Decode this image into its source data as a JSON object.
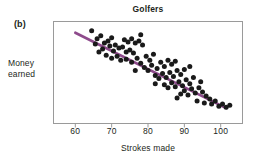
{
  "figure": {
    "panel_label": "(b)",
    "title": "Golfers",
    "ylabel_line1": "Money",
    "ylabel_line2": "earned",
    "xlabel": "Strokes made"
  },
  "colors": {
    "trendline": "#8e4b8c",
    "points": "#1a1a1a",
    "frame": "#9a9a9a",
    "text": "#231f20",
    "background": "#ffffff"
  },
  "chart_data": {
    "type": "scatter",
    "title": "Golfers",
    "panel": "(b)",
    "xlabel": "Strokes made",
    "ylabel": "Money earned",
    "grid": false,
    "legend": null,
    "xlim": [
      54,
      106
    ],
    "ylim": [
      0,
      100
    ],
    "xticks": [
      60,
      70,
      80,
      90,
      100
    ],
    "xticklabels": [
      "60",
      "70",
      "80",
      "90",
      "100"
    ],
    "yticks": [],
    "yticklabels": [],
    "trendline": {
      "type": "linear-fit",
      "color": "#8e4b8c",
      "x_start": 60.0,
      "y_start": 89.0,
      "x_end": 101.5,
      "y_end": 15.0
    },
    "points": [
      {
        "x": 64.5,
        "y": 91.0
      },
      {
        "x": 66.0,
        "y": 83.0
      },
      {
        "x": 67.0,
        "y": 86.0
      },
      {
        "x": 65.5,
        "y": 78.0
      },
      {
        "x": 68.0,
        "y": 79.0
      },
      {
        "x": 67.5,
        "y": 73.0
      },
      {
        "x": 69.0,
        "y": 81.0
      },
      {
        "x": 70.0,
        "y": 84.0
      },
      {
        "x": 69.5,
        "y": 76.0
      },
      {
        "x": 71.0,
        "y": 77.0
      },
      {
        "x": 70.5,
        "y": 71.0
      },
      {
        "x": 72.0,
        "y": 74.0
      },
      {
        "x": 73.5,
        "y": 82.0
      },
      {
        "x": 74.5,
        "y": 80.0
      },
      {
        "x": 75.5,
        "y": 83.0
      },
      {
        "x": 76.5,
        "y": 79.0
      },
      {
        "x": 77.5,
        "y": 81.0
      },
      {
        "x": 78.5,
        "y": 77.0
      },
      {
        "x": 73.0,
        "y": 75.0
      },
      {
        "x": 74.0,
        "y": 70.0
      },
      {
        "x": 75.0,
        "y": 72.0
      },
      {
        "x": 76.0,
        "y": 69.0
      },
      {
        "x": 68.5,
        "y": 67.0
      },
      {
        "x": 70.0,
        "y": 64.0
      },
      {
        "x": 71.5,
        "y": 66.0
      },
      {
        "x": 72.5,
        "y": 62.0
      },
      {
        "x": 74.0,
        "y": 63.0
      },
      {
        "x": 75.5,
        "y": 60.0
      },
      {
        "x": 77.0,
        "y": 64.0
      },
      {
        "x": 78.0,
        "y": 59.0
      },
      {
        "x": 79.5,
        "y": 66.0
      },
      {
        "x": 80.5,
        "y": 62.0
      },
      {
        "x": 81.5,
        "y": 68.0
      },
      {
        "x": 79.0,
        "y": 55.0
      },
      {
        "x": 80.0,
        "y": 52.0
      },
      {
        "x": 81.0,
        "y": 57.0
      },
      {
        "x": 82.5,
        "y": 54.0
      },
      {
        "x": 83.5,
        "y": 60.0
      },
      {
        "x": 84.5,
        "y": 56.0
      },
      {
        "x": 85.5,
        "y": 62.0
      },
      {
        "x": 86.5,
        "y": 58.0
      },
      {
        "x": 87.5,
        "y": 61.0
      },
      {
        "x": 82.0,
        "y": 47.0
      },
      {
        "x": 83.0,
        "y": 44.0
      },
      {
        "x": 84.0,
        "y": 49.0
      },
      {
        "x": 85.0,
        "y": 45.0
      },
      {
        "x": 86.0,
        "y": 50.0
      },
      {
        "x": 87.0,
        "y": 46.0
      },
      {
        "x": 88.0,
        "y": 52.0
      },
      {
        "x": 89.0,
        "y": 48.0
      },
      {
        "x": 90.0,
        "y": 53.0
      },
      {
        "x": 84.5,
        "y": 38.0
      },
      {
        "x": 85.5,
        "y": 35.0
      },
      {
        "x": 86.5,
        "y": 40.0
      },
      {
        "x": 87.5,
        "y": 36.0
      },
      {
        "x": 88.5,
        "y": 41.0
      },
      {
        "x": 89.5,
        "y": 37.0
      },
      {
        "x": 90.5,
        "y": 43.0
      },
      {
        "x": 91.5,
        "y": 39.0
      },
      {
        "x": 92.5,
        "y": 45.0
      },
      {
        "x": 89.0,
        "y": 29.0
      },
      {
        "x": 90.0,
        "y": 32.0
      },
      {
        "x": 91.0,
        "y": 28.0
      },
      {
        "x": 92.0,
        "y": 34.0
      },
      {
        "x": 93.0,
        "y": 30.0
      },
      {
        "x": 94.0,
        "y": 35.0
      },
      {
        "x": 95.0,
        "y": 31.0
      },
      {
        "x": 96.0,
        "y": 27.0
      },
      {
        "x": 97.0,
        "y": 24.0
      },
      {
        "x": 93.5,
        "y": 22.0
      },
      {
        "x": 95.5,
        "y": 20.0
      },
      {
        "x": 97.5,
        "y": 19.0
      },
      {
        "x": 98.5,
        "y": 22.0
      },
      {
        "x": 99.5,
        "y": 17.0
      },
      {
        "x": 100.5,
        "y": 19.0
      },
      {
        "x": 101.5,
        "y": 16.0
      },
      {
        "x": 102.5,
        "y": 18.0
      },
      {
        "x": 91.5,
        "y": 56.0
      },
      {
        "x": 78.0,
        "y": 87.0
      },
      {
        "x": 66.5,
        "y": 70.0
      },
      {
        "x": 88.0,
        "y": 25.0
      },
      {
        "x": 82.0,
        "y": 39.0
      },
      {
        "x": 76.5,
        "y": 52.0
      },
      {
        "x": 94.5,
        "y": 41.0
      }
    ]
  }
}
